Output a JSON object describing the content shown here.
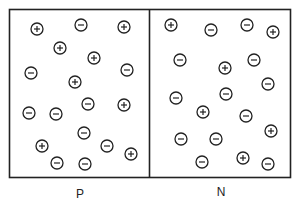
{
  "diagram": {
    "title": "",
    "regions": [
      {
        "label": "P",
        "charges": [
          {
            "x": 37,
            "y": 29,
            "sign": "+"
          },
          {
            "x": 81,
            "y": 25,
            "sign": "-"
          },
          {
            "x": 124,
            "y": 27,
            "sign": "+"
          },
          {
            "x": 60,
            "y": 48,
            "sign": "+"
          },
          {
            "x": 94,
            "y": 58,
            "sign": "+"
          },
          {
            "x": 31,
            "y": 73,
            "sign": "-"
          },
          {
            "x": 75,
            "y": 82,
            "sign": "+"
          },
          {
            "x": 127,
            "y": 70,
            "sign": "-"
          },
          {
            "x": 29,
            "y": 113,
            "sign": "-"
          },
          {
            "x": 56,
            "y": 114,
            "sign": "-"
          },
          {
            "x": 88,
            "y": 104,
            "sign": "-"
          },
          {
            "x": 124,
            "y": 105,
            "sign": "+"
          },
          {
            "x": 84,
            "y": 133,
            "sign": "-"
          },
          {
            "x": 42,
            "y": 146,
            "sign": "+"
          },
          {
            "x": 107,
            "y": 146,
            "sign": "-"
          },
          {
            "x": 131,
            "y": 154,
            "sign": "+"
          },
          {
            "x": 57,
            "y": 163,
            "sign": "-"
          },
          {
            "x": 85,
            "y": 164,
            "sign": "-"
          }
        ]
      },
      {
        "label": "N",
        "charges": [
          {
            "x": 171,
            "y": 25,
            "sign": "+"
          },
          {
            "x": 211,
            "y": 30,
            "sign": "-"
          },
          {
            "x": 247,
            "y": 25,
            "sign": "-"
          },
          {
            "x": 273,
            "y": 32,
            "sign": "+"
          },
          {
            "x": 180,
            "y": 60,
            "sign": "-"
          },
          {
            "x": 225,
            "y": 68,
            "sign": "+"
          },
          {
            "x": 254,
            "y": 60,
            "sign": "-"
          },
          {
            "x": 268,
            "y": 84,
            "sign": "-"
          },
          {
            "x": 176,
            "y": 98,
            "sign": "-"
          },
          {
            "x": 226,
            "y": 94,
            "sign": "-"
          },
          {
            "x": 203,
            "y": 112,
            "sign": "+"
          },
          {
            "x": 246,
            "y": 116,
            "sign": "-"
          },
          {
            "x": 271,
            "y": 131,
            "sign": "+"
          },
          {
            "x": 181,
            "y": 139,
            "sign": "-"
          },
          {
            "x": 216,
            "y": 139,
            "sign": "-"
          },
          {
            "x": 202,
            "y": 162,
            "sign": "-"
          },
          {
            "x": 243,
            "y": 158,
            "sign": "+"
          },
          {
            "x": 268,
            "y": 164,
            "sign": "-"
          }
        ]
      }
    ],
    "colors": {
      "stroke": "#222222",
      "background": "#ffffff"
    }
  }
}
